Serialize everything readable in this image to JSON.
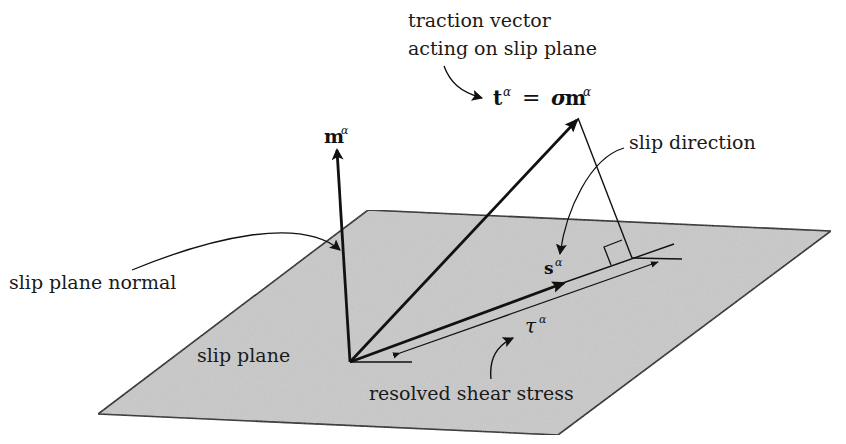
{
  "figure": {
    "labels": {
      "traction_line1": "traction vector",
      "traction_line2": "acting on slip plane",
      "traction_eq_t": "t",
      "traction_eq_alpha": "α",
      "traction_eq_equals": "=",
      "traction_eq_sigma": "σ",
      "traction_eq_m": "m",
      "traction_eq_alpha2": "α",
      "m_vector": "m",
      "m_vector_sup": "α",
      "slip_direction": "slip direction",
      "s_vector": "s",
      "s_vector_sup": "α",
      "slip_plane_normal": "slip plane normal",
      "slip_plane": "slip plane",
      "tau": "τ",
      "tau_sup": "α",
      "resolved_shear_stress": "resolved shear stress"
    },
    "colors": {
      "plane_fill": "#c9c9c9",
      "stroke": "#1a1a1a",
      "background": "#ffffff"
    }
  }
}
